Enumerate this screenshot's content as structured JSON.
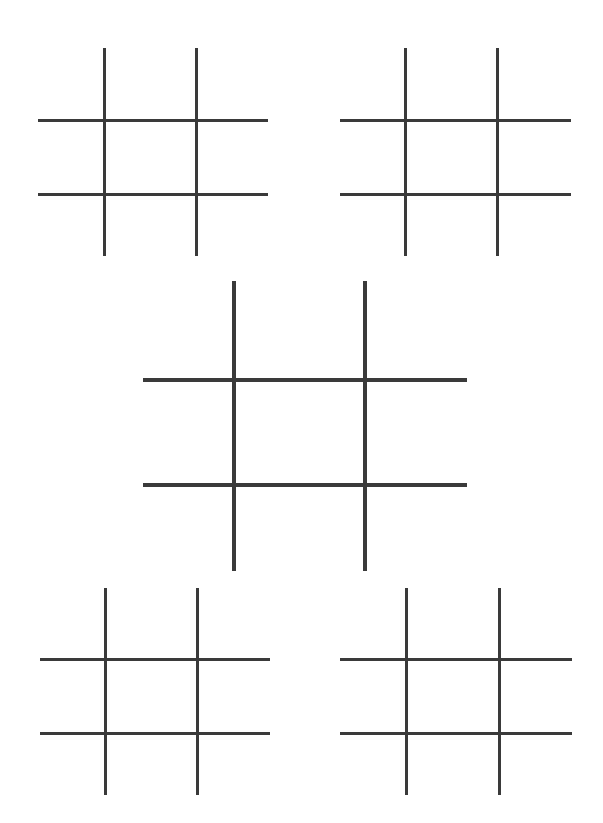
{
  "game": {
    "type": "tic-tac-toe",
    "line_color": "#3a3a3a",
    "background": "#ffffff",
    "boards": [
      {
        "id": "top-left",
        "thickness": 3,
        "vertical_x": [
          104,
          196
        ],
        "vertical_y": [
          48,
          256
        ],
        "horizontal_y": [
          120,
          194
        ],
        "horizontal_x": [
          38,
          268
        ],
        "cells": [
          "",
          "",
          "",
          "",
          "",
          "",
          "",
          "",
          ""
        ]
      },
      {
        "id": "top-right",
        "thickness": 3,
        "vertical_x": [
          405,
          497
        ],
        "vertical_y": [
          48,
          256
        ],
        "horizontal_y": [
          120,
          194
        ],
        "horizontal_x": [
          340,
          571
        ],
        "cells": [
          "",
          "",
          "",
          "",
          "",
          "",
          "",
          "",
          ""
        ]
      },
      {
        "id": "center",
        "thickness": 4,
        "vertical_x": [
          234,
          365
        ],
        "vertical_y": [
          281,
          571
        ],
        "horizontal_y": [
          380,
          485
        ],
        "horizontal_x": [
          143,
          467
        ],
        "cells": [
          "",
          "",
          "",
          "",
          "",
          "",
          "",
          "",
          ""
        ]
      },
      {
        "id": "bottom-left",
        "thickness": 3,
        "vertical_x": [
          105,
          197
        ],
        "vertical_y": [
          588,
          795
        ],
        "horizontal_y": [
          659,
          733
        ],
        "horizontal_x": [
          40,
          270
        ],
        "cells": [
          "",
          "",
          "",
          "",
          "",
          "",
          "",
          "",
          ""
        ]
      },
      {
        "id": "bottom-right",
        "thickness": 3,
        "vertical_x": [
          406,
          499
        ],
        "vertical_y": [
          588,
          795
        ],
        "horizontal_y": [
          659,
          733
        ],
        "horizontal_x": [
          340,
          572
        ],
        "cells": [
          "",
          "",
          "",
          "",
          "",
          "",
          "",
          "",
          ""
        ]
      }
    ]
  }
}
